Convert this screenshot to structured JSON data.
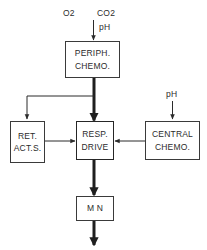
{
  "diagram": {
    "background_color": "#ffffff",
    "stroke_color": "#2b2b2b",
    "text_color": "#2b2b2b",
    "inputs": [
      {
        "id": "o2",
        "label": "O2"
      },
      {
        "id": "co2",
        "label": "CO2"
      },
      {
        "id": "ph_top",
        "label": "pH"
      },
      {
        "id": "ph_central",
        "label": "pH"
      }
    ],
    "nodes": [
      {
        "id": "periph-chemo",
        "lines": [
          "PERIPH.",
          "CHEMO."
        ],
        "line1": "PERIPH.",
        "line2": "CHEMO."
      },
      {
        "id": "ret-act-s",
        "lines": [
          "RET.",
          "ACT.S."
        ],
        "line1": "RET.",
        "line2": "ACT.S."
      },
      {
        "id": "resp-drive",
        "lines": [
          "RESP.",
          "DRIVE"
        ],
        "line1": "RESP.",
        "line2": "DRIVE"
      },
      {
        "id": "central-chemo",
        "lines": [
          "CENTRAL",
          "CHEMO."
        ],
        "line1": "CENTRAL",
        "line2": "CHEMO."
      },
      {
        "id": "mn",
        "lines": [
          "M N"
        ],
        "line1": "M N"
      }
    ],
    "edges": [
      {
        "id": "inputs-to-periph",
        "from": "inputs",
        "to": "periph-chemo",
        "weight": "thin"
      },
      {
        "id": "periph-to-resp",
        "from": "periph-chemo",
        "to": "resp-drive",
        "weight": "thick"
      },
      {
        "id": "periph-to-ret",
        "from": "periph-chemo",
        "to": "ret-act-s",
        "weight": "thin"
      },
      {
        "id": "ret-to-resp",
        "from": "ret-act-s",
        "to": "resp-drive",
        "weight": "thin"
      },
      {
        "id": "central-to-resp",
        "from": "central-chemo",
        "to": "resp-drive",
        "weight": "thin"
      },
      {
        "id": "ph-to-central",
        "from": "ph_central",
        "to": "central-chemo",
        "weight": "thin"
      },
      {
        "id": "resp-to-mn",
        "from": "resp-drive",
        "to": "mn",
        "weight": "thick"
      },
      {
        "id": "mn-output",
        "from": "mn",
        "to": "output",
        "weight": "thick"
      }
    ]
  }
}
